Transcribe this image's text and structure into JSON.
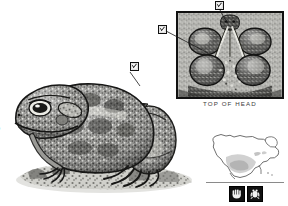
{
  "plate": {
    "type": "field-guide-illustration",
    "subject": "toad",
    "style": "grayscale stipple engraving",
    "background_color": "#ffffff",
    "ink_color": "#231f20"
  },
  "clipped_caption": {
    "line1": "mp",
    "line2": "s",
    "note_visible": "text clipped at left page edge"
  },
  "main_illustration": {
    "name": "toad-lateral-view",
    "marker": {
      "label": "1",
      "glyph": "boxed-pointer",
      "position_hint": "dorsal back, upper right of toad"
    }
  },
  "inset_panel": {
    "label": "TOP OF HEAD",
    "frame_color": "#111111",
    "fill_color": "#cfcfcf",
    "markers": [
      {
        "label": "2",
        "glyph": "boxed-pointer",
        "leader": "cranial crest, top center"
      },
      {
        "label": "3",
        "glyph": "boxed-pointer",
        "leader": "parotoid gland, left side"
      }
    ]
  },
  "range_map": {
    "name": "north-america-range-map",
    "continent": "North America",
    "range_fill": "#c9c9c9",
    "outline_color": "#5f5f5f",
    "baseline": true
  },
  "icon_badges": [
    {
      "name": "hand-size-icon",
      "glyph": "hand",
      "color": "#111111"
    },
    {
      "name": "toad-silhouette-icon",
      "glyph": "toad",
      "color": "#111111"
    }
  ],
  "colors": {
    "ink": "#231f20",
    "mid_gray": "#8a8a8a",
    "light_gray": "#cfcfcf",
    "paper": "#ffffff"
  }
}
